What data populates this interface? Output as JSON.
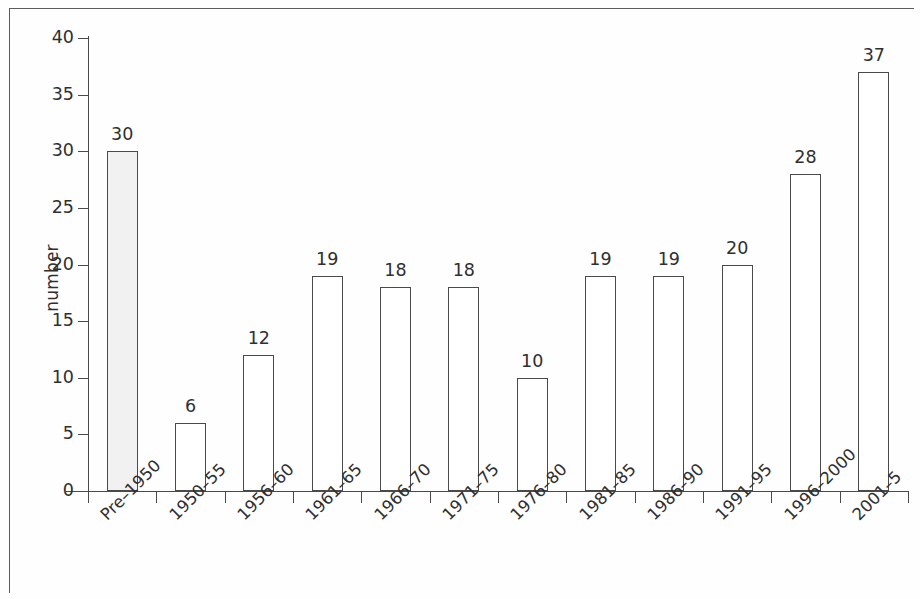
{
  "figure": {
    "frame_color": "#5b5b5b",
    "axis_color": "#4a4a4a",
    "shaded_bar_fill": "#f1f1f1"
  },
  "chart_data": {
    "type": "bar",
    "title": "",
    "xlabel": "",
    "ylabel": "number",
    "ylim": [
      0,
      40
    ],
    "y_ticks": [
      0,
      5,
      10,
      15,
      20,
      25,
      30,
      35,
      40
    ],
    "grid": false,
    "legend": null,
    "categories": [
      "Pre–1950",
      "1950–55",
      "1956–60",
      "1961–65",
      "1966–70",
      "1971–75",
      "1976–80",
      "1981–85",
      "1986–90",
      "1991–95",
      "1996–2000",
      "2001–5"
    ],
    "values": [
      30,
      6,
      12,
      19,
      18,
      18,
      10,
      19,
      19,
      20,
      28,
      37
    ],
    "data_labels": [
      "30",
      "6",
      "12",
      "19",
      "18",
      "18",
      "10",
      "19",
      "19",
      "20",
      "28",
      "37"
    ],
    "bar_styles": [
      "shaded",
      "open",
      "open",
      "open",
      "open",
      "open",
      "open",
      "open",
      "open",
      "open",
      "open",
      "open"
    ]
  }
}
